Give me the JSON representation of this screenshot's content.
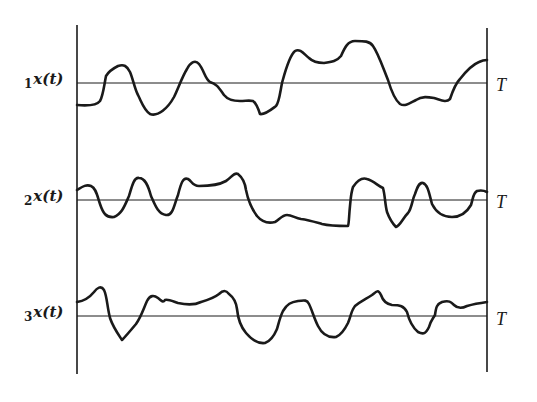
{
  "figure": {
    "stroke_color": "#1a1a1a",
    "background": "#ffffff"
  },
  "axes": {
    "left_axis_label": "",
    "right_axis_label": "T"
  },
  "rows": [
    {
      "subscript": "1",
      "func": "x(t)",
      "end_label": "T"
    },
    {
      "subscript": "2",
      "func": "x(t)",
      "end_label": "T"
    },
    {
      "subscript": "3",
      "func": "x(t)",
      "end_label": "T"
    }
  ]
}
